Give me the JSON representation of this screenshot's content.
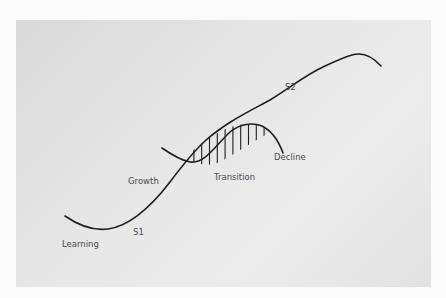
{
  "diagram": {
    "colors": {
      "stroke": "#1e1e1e",
      "label": "#4a4a4a",
      "panel": "#e4e4e4"
    },
    "curves": [
      {
        "id": "s1",
        "name": "First S-curve"
      },
      {
        "id": "s2",
        "name": "Second S-curve (transition hump)"
      }
    ],
    "labels": {
      "learning": "Learning",
      "s1": "S1",
      "growth": "Growth",
      "transition": "Transition",
      "decline": "Decline",
      "s2": "S2"
    },
    "hatch": {
      "description": "Vertical hatch lines filling the overlap region between curves",
      "count": 10
    }
  }
}
